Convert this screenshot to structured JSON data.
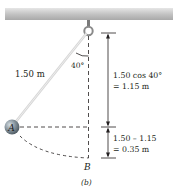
{
  "figure": {
    "caption": "(b)",
    "pendulum_length_label": "1.50 m",
    "angle_label": "40°",
    "point_A_label": "A",
    "point_B_label": "B",
    "dimension_upper": {
      "line1": "1.50 cos 40°",
      "line2": "= 1.15 m"
    },
    "dimension_lower": {
      "line1": "1.50 – 1.15",
      "line2": "= 0.35 m"
    }
  },
  "colors": {
    "beam": "#c8c8c8",
    "rod": "#d9d9d9",
    "ball": "#7f8c95",
    "ink": "#231f20"
  }
}
